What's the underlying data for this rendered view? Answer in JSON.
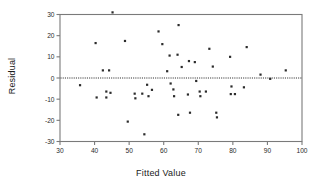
{
  "chart_data": {
    "type": "scatter",
    "title": "",
    "xlabel": "Fitted Value",
    "ylabel": "Residual",
    "xlim": [
      30,
      100
    ],
    "ylim": [
      -30,
      30
    ],
    "xticks": [
      30,
      40,
      50,
      60,
      70,
      80,
      90,
      100
    ],
    "yticks": [
      30,
      20,
      10,
      0,
      -10,
      -20,
      -30
    ],
    "grid": false,
    "legend": null,
    "reference_line": {
      "orientation": "horizontal",
      "y": 0,
      "style": "dotted",
      "color": "#303030"
    },
    "marker": {
      "shape": "square",
      "color": "#2b2b2b",
      "size_px": 2.2
    },
    "points": [
      {
        "x": 45.2,
        "y": 31.0
      },
      {
        "x": 58.5,
        "y": 22.0
      },
      {
        "x": 64.3,
        "y": 25.0
      },
      {
        "x": 40.3,
        "y": 16.5
      },
      {
        "x": 48.8,
        "y": 17.5
      },
      {
        "x": 59.6,
        "y": 16.0
      },
      {
        "x": 84.0,
        "y": 14.6
      },
      {
        "x": 73.2,
        "y": 13.8
      },
      {
        "x": 61.7,
        "y": 10.6
      },
      {
        "x": 64.0,
        "y": 11.0
      },
      {
        "x": 79.2,
        "y": 10.0
      },
      {
        "x": 67.3,
        "y": 8.0
      },
      {
        "x": 69.0,
        "y": 7.5
      },
      {
        "x": 65.2,
        "y": 5.2
      },
      {
        "x": 74.2,
        "y": 5.4
      },
      {
        "x": 42.4,
        "y": 3.6
      },
      {
        "x": 44.2,
        "y": 3.6
      },
      {
        "x": 61.0,
        "y": 3.2
      },
      {
        "x": 95.3,
        "y": 3.6
      },
      {
        "x": 88.0,
        "y": 1.6
      },
      {
        "x": 90.8,
        "y": -0.4
      },
      {
        "x": 69.4,
        "y": -1.4
      },
      {
        "x": 35.8,
        "y": -3.4
      },
      {
        "x": 55.2,
        "y": -3.2
      },
      {
        "x": 62.0,
        "y": -2.6
      },
      {
        "x": 56.6,
        "y": -5.6
      },
      {
        "x": 62.8,
        "y": -5.4
      },
      {
        "x": 83.2,
        "y": -4.4
      },
      {
        "x": 79.6,
        "y": -4.0
      },
      {
        "x": 43.4,
        "y": -6.4
      },
      {
        "x": 44.6,
        "y": -7.0
      },
      {
        "x": 51.6,
        "y": -7.4
      },
      {
        "x": 53.8,
        "y": -7.4
      },
      {
        "x": 67.0,
        "y": -7.8
      },
      {
        "x": 70.4,
        "y": -6.4
      },
      {
        "x": 72.2,
        "y": -6.4
      },
      {
        "x": 63.0,
        "y": -8.6
      },
      {
        "x": 40.6,
        "y": -9.2
      },
      {
        "x": 43.4,
        "y": -9.2
      },
      {
        "x": 51.8,
        "y": -9.6
      },
      {
        "x": 55.6,
        "y": -8.6
      },
      {
        "x": 70.6,
        "y": -8.6
      },
      {
        "x": 79.4,
        "y": -7.6
      },
      {
        "x": 80.6,
        "y": -7.6
      },
      {
        "x": 64.2,
        "y": -17.4
      },
      {
        "x": 67.6,
        "y": -16.4
      },
      {
        "x": 75.2,
        "y": -16.4
      },
      {
        "x": 75.4,
        "y": -18.6
      },
      {
        "x": 49.6,
        "y": -20.6
      },
      {
        "x": 54.4,
        "y": -26.6
      }
    ]
  }
}
